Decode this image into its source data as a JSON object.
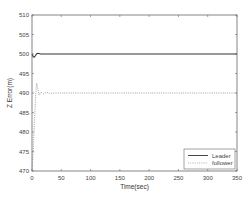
{
  "chart_data": {
    "type": "line",
    "title": "",
    "xlabel": "Time(sec)",
    "ylabel": "Z Error(m)",
    "xlim": [
      0,
      350
    ],
    "ylim": [
      470,
      510
    ],
    "xticks": [
      "0",
      "50",
      "100",
      "150",
      "200",
      "250",
      "300",
      "350"
    ],
    "yticks": [
      "470",
      "475",
      "480",
      "485",
      "490",
      "495",
      "500",
      "505",
      "510"
    ],
    "grid": false,
    "legend_position": "lower right",
    "series": [
      {
        "name": "Leader",
        "style": "solid",
        "color": "#333333",
        "x": [
          0,
          2,
          4,
          6,
          8,
          10,
          15,
          20,
          50,
          100,
          150,
          200,
          250,
          300,
          350
        ],
        "y": [
          500,
          499.3,
          499.2,
          499.6,
          500.1,
          500.2,
          500,
          500,
          500,
          500,
          500,
          500,
          500,
          500,
          500
        ]
      },
      {
        "name": "follower",
        "style": "dotted",
        "color": "#888888",
        "x": [
          0,
          2,
          4,
          6,
          8,
          10,
          12,
          15,
          20,
          25,
          30,
          40,
          50,
          100,
          150,
          200,
          250,
          300,
          350
        ],
        "y": [
          470,
          475,
          482,
          489,
          492.5,
          491,
          489.5,
          490.2,
          489.8,
          490.2,
          489.9,
          490,
          490,
          490,
          490,
          490,
          490,
          490,
          490
        ]
      }
    ]
  }
}
